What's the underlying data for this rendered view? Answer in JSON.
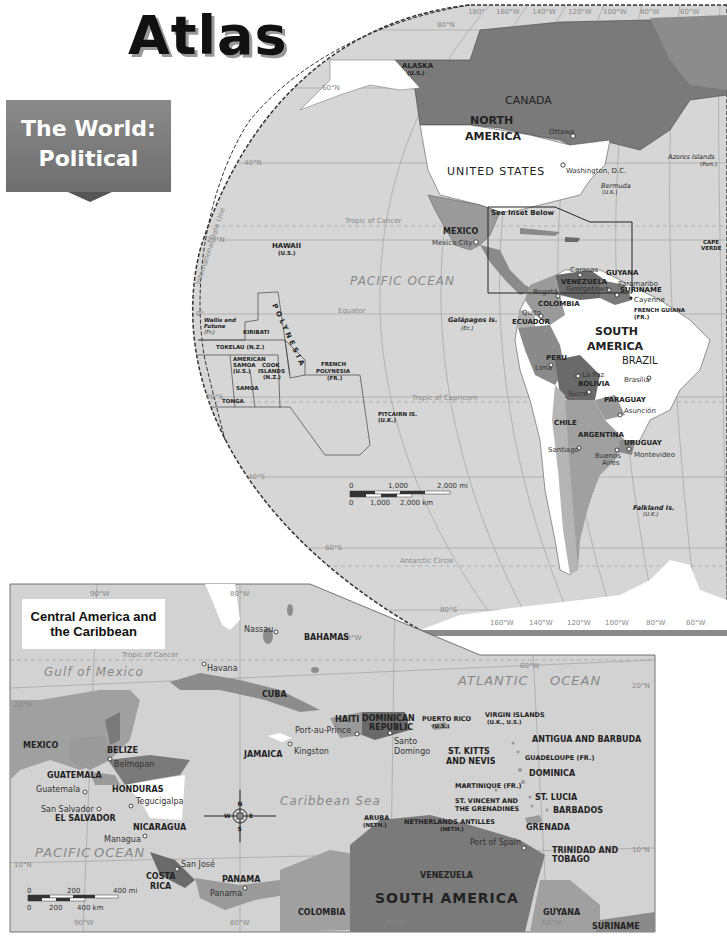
{
  "header": {
    "title": "Atlas",
    "banner_line1": "The World:",
    "banner_line2": "Political"
  },
  "world_map": {
    "graticule": {
      "longitudes": [
        "180°",
        "160°W",
        "140°W",
        "120°W",
        "100°W",
        "80°W",
        "60°W"
      ],
      "latitudes": [
        "80°N",
        "60°N",
        "40°N",
        "20°N",
        "0°",
        "20°S",
        "40°S",
        "60°S",
        "80°S"
      ],
      "bottom_longitudes": [
        "160°W",
        "140°W",
        "120°W",
        "100°W",
        "80°W",
        "60°W"
      ]
    },
    "lines": {
      "tropic_cancer": "Tropic of Cancer",
      "equator": "Equator",
      "tropic_capricorn": "Tropic of Capricorn",
      "antarctic_circle": "Antarctic Circle",
      "date_line": "International Date Line"
    },
    "regions": {
      "north_america_1": "NORTH",
      "north_america_2": "AMERICA",
      "south_america_1": "SOUTH",
      "south_america_2": "AMERICA"
    },
    "countries": {
      "canada": "CANADA",
      "usa": "UNITED STATES",
      "mexico": "MEXICO",
      "alaska": "ALASKA",
      "alaska_sub": "(U.S.)",
      "hawaii": "HAWAII",
      "hawaii_sub": "(U.S.)",
      "venezuela": "VENEZUELA",
      "guyana": "GUYANA",
      "suriname": "SURINAME",
      "french_guiana": "FRENCH GUIANA",
      "french_guiana_sub": "(FR.)",
      "colombia": "COLOMBIA",
      "ecuador": "ECUADOR",
      "peru": "PERU",
      "brazil": "BRAZIL",
      "bolivia": "BOLIVIA",
      "paraguay": "PARAGUAY",
      "chile": "CHILE",
      "argentina": "ARGENTINA",
      "uruguay": "URUGUAY",
      "cape_verde_1": "CAPE",
      "cape_verde_2": "VERDE"
    },
    "oceania": {
      "polynesia": "POLYNESIA",
      "kiribati": "KIRIBATI",
      "wallis_1": "Wallis and",
      "wallis_2": "Futuna",
      "wallis_sub": "(Fr.)",
      "tokelau": "TOKELAU (N.Z.)",
      "am_samoa_1": "AMERICAN",
      "am_samoa_2": "SAMOA",
      "am_samoa_sub": "(U.S.)",
      "cook_1": "COOK",
      "cook_2": "ISLANDS",
      "cook_sub": "(N.Z.)",
      "samoa": "SAMOA",
      "tonga": "TONGA",
      "fr_poly_1": "FRENCH",
      "fr_poly_2": "POLYNESIA",
      "fr_poly_sub": "(FR.)",
      "pitcairn": "PITCAIRN IS.",
      "pitcairn_sub": "(U.K.)"
    },
    "islands": {
      "azores": "Azores Islands",
      "azores_sub": "(Port.)",
      "bermuda": "Bermuda",
      "bermuda_sub": "(U.K.)",
      "galapagos": "Galápagos Is.",
      "galapagos_sub": "(Ec.)",
      "falkland": "Falkland Is.",
      "falkland_sub": "(U.K.)"
    },
    "cities": {
      "ottawa": "Ottawa",
      "washington": "Washington, D.C.",
      "mexico_city": "Mexico City",
      "caracas": "Caracas",
      "bogota": "Bogotá",
      "georgetown": "Georgetown",
      "paramaribo": "Paramaribo",
      "cayenne": "Cayenne",
      "quito": "Quito",
      "lima": "Lima",
      "la_paz": "La Paz",
      "sucre": "Sucre",
      "brasilia": "Brasília",
      "asuncion": "Asunción",
      "santiago": "Santiago",
      "buenos_aires_1": "Buenos",
      "buenos_aires_2": "Aires",
      "montevideo": "Montevideo"
    },
    "oceans": {
      "pacific": "PACIFIC OCEAN"
    },
    "inset_note": "See Inset Below",
    "scale": {
      "mi_labels": [
        "0",
        "1,000",
        "2,000 mi"
      ],
      "km_labels": [
        "0",
        "1,000",
        "2,000 km"
      ]
    }
  },
  "inset_map": {
    "title_line1": "Central America and",
    "title_line2": "the Caribbean",
    "graticule": {
      "top": [
        "90°W",
        "80°W",
        "70°W",
        "60°W"
      ],
      "bottom": [
        "90°W",
        "80°W",
        "70°W",
        "60°W"
      ],
      "left": [
        "20°N",
        "10°N"
      ],
      "right": [
        "20°N",
        "10°N"
      ]
    },
    "tropic_cancer": "Tropic of Cancer",
    "water": {
      "gulf": "Gulf of Mexico",
      "atlantic_1": "ATLANTIC",
      "atlantic_2": "OCEAN",
      "caribbean": "Caribbean Sea",
      "pacific_1": "PACIFIC",
      "pacific_2": "OCEAN"
    },
    "countries": {
      "mexico": "MEXICO",
      "belize": "BELIZE",
      "guatemala": "GUATEMALA",
      "honduras": "HONDURAS",
      "el_salvador": "EL SALVADOR",
      "nicaragua": "NICARAGUA",
      "costa_rica_1": "COSTA",
      "costa_rica_2": "RICA",
      "panama": "PANAMA",
      "colombia": "COLOMBIA",
      "venezuela": "VENEZUELA",
      "guyana": "GUYANA",
      "suriname": "SURINAME",
      "south_america": "SOUTH AMERICA",
      "bahamas": "BAHAMAS",
      "cuba": "CUBA",
      "jamaica": "JAMAICA",
      "haiti": "HAITI",
      "dominican_1": "DOMINICAN",
      "dominican_2": "REPUBLIC",
      "puerto_rico": "PUERTO RICO",
      "puerto_rico_sub": "(U.S.)",
      "virgin": "VIRGIN ISLANDS",
      "virgin_sub": "(U.K., U.S.)",
      "antigua": "ANTIGUA AND BARBUDA",
      "st_kitts_1": "ST. KITTS",
      "st_kitts_2": "AND NEVIS",
      "guadeloupe": "GUADELOUPE (FR.)",
      "dominica": "DOMINICA",
      "martinique": "MARTINIQUE (FR.)",
      "st_lucia": "ST. LUCIA",
      "st_vincent_1": "ST. VINCENT AND",
      "st_vincent_2": "THE GRENADINES",
      "barbados": "BARBADOS",
      "grenada": "GRENADA",
      "aruba": "ARUBA",
      "aruba_sub": "(NETH.)",
      "neth_antilles": "NETHERLANDS ANTILLES",
      "neth_antilles_sub": "(NETH.)",
      "trinidad_1": "TRINIDAD AND",
      "trinidad_2": "TOBAGO"
    },
    "cities": {
      "nassau": "Nassau",
      "havana": "Havana",
      "port_au_prince": "Port-au-Prince",
      "santo_domingo_1": "Santo",
      "santo_domingo_2": "Domingo",
      "kingston": "Kingston",
      "belmopan": "Belmopan",
      "guatemala": "Guatemala",
      "tegucigalpa": "Tegucigalpa",
      "san_salvador": "San Salvador",
      "managua": "Managua",
      "san_jose": "San José",
      "panama": "Panama",
      "port_of_spain": "Port of Spain"
    },
    "compass": {
      "n": "N",
      "s": "S",
      "e": "E",
      "w": "W"
    },
    "scale": {
      "mi_labels": [
        "0",
        "200",
        "400 mi"
      ],
      "km_labels": [
        "0",
        "200",
        "400 km"
      ]
    }
  },
  "colors": {
    "ocean": "#d4d4d4",
    "land_light": "#ffffff",
    "land_mid": "#a8a8a8",
    "land_dark": "#7a7a7a",
    "land_darker": "#5e5e5e",
    "banner": "#7c7c7c"
  }
}
